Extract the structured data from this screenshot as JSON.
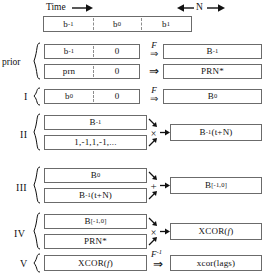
{
  "header": {
    "time_label": "Time",
    "time_arrow": "right-arrow",
    "n_label": "N",
    "n_arrow_left": "left-arrow",
    "n_arrow_right": "right-arrow"
  },
  "timeline": {
    "cells": [
      "b-1",
      "b0",
      "b1"
    ],
    "cell_display": [
      "b",
      "b",
      "b"
    ],
    "subs": [
      "-1",
      "0",
      "1"
    ]
  },
  "groups": [
    {
      "id": "prior",
      "label": "prior",
      "rows": [
        {
          "left_cells": [
            "b-1",
            "0"
          ],
          "left_text_a": "b",
          "left_sub_a": "-1",
          "left_text_b": "0",
          "operator": "F",
          "operator_arrow": "double-right-arrow",
          "right_text": "B",
          "right_sub": "-1"
        },
        {
          "left_cells": [
            "prn",
            "0"
          ],
          "left_text_a": "prn",
          "left_text_b": "0",
          "operator": "F",
          "operator_arrow": "double-right-arrow",
          "right_text": "PRN*"
        }
      ]
    },
    {
      "id": "I",
      "label": "I",
      "rows": [
        {
          "left_text_a": "b",
          "left_sub_a": "0",
          "left_text_b": "0",
          "operator": "F",
          "operator_arrow": "double-right-arrow",
          "right_text": "B",
          "right_sub": "0"
        }
      ]
    },
    {
      "id": "II",
      "label": "II",
      "inputs": [
        "B-1",
        "1,-1,1,-1,..."
      ],
      "input_a_text": "B",
      "input_a_sub": "-1",
      "input_b_text": "1,-1,1,-1,...",
      "operator": "×",
      "output_text": "B",
      "output_sub": "-1",
      "output_suffix": "(t+N)"
    },
    {
      "id": "III",
      "label": "III",
      "input_a_text": "B",
      "input_a_sub": "0",
      "input_b_text": "B",
      "input_b_sub": "-1",
      "input_b_suffix": "(t+N)",
      "operator": "+",
      "output_text": "B",
      "output_sub": "[-1,0]"
    },
    {
      "id": "IV",
      "label": "IV",
      "input_a_text": "B",
      "input_a_sub": "[-1,0]",
      "input_b_text": "PRN*",
      "operator": "×",
      "output_text": "XCOR(",
      "output_var": "f",
      "output_text_end": ")"
    },
    {
      "id": "V",
      "label": "V",
      "input_text": "XCOR(",
      "input_var": "f",
      "input_text_end": ")",
      "operator": "F",
      "operator_sup": "-1",
      "operator_arrow": "double-right-arrow",
      "output_text": "xcor(lags)"
    }
  ],
  "colors": {
    "box_border": "#6b6b6b",
    "dash": "#8e8e8e",
    "text": "#111111",
    "background": "#ffffff"
  }
}
